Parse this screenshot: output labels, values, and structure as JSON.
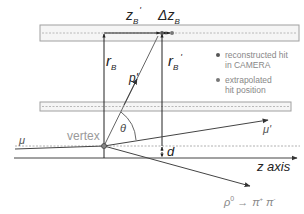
{
  "labels": {
    "z_b_prime": "z",
    "z_b_prime_sub": "B",
    "z_b_prime_sup": "'",
    "delta_z_b": "Δz",
    "delta_z_b_sub": "B",
    "r_b": "r",
    "r_b_sub": "B",
    "r_b_prime": "r",
    "r_b_prime_sub": "B",
    "r_b_prime_sup": "'",
    "p_prime": "p'",
    "theta": "θ",
    "mu": "μ",
    "mu_prime": "μ'",
    "vertex": "vertex",
    "d": "d",
    "z_axis": "z axis",
    "rho": "ρ",
    "rho_sup": "0",
    "arrow": "→",
    "pi_plus": "π",
    "pi_plus_sup": "+",
    "pi_minus": "π",
    "pi_minus_sup": "-"
  },
  "legend": {
    "items": [
      {
        "line1": "reconstructed hit",
        "line2": "in CAMERA"
      },
      {
        "line1": "extrapolated",
        "line2": "hit position"
      }
    ]
  },
  "colors": {
    "line": "#222222",
    "detector_edge": "#9a9a9a",
    "detector_fill": "#f4f4f4",
    "dashed": "#b0b0b0",
    "light_text": "#9a9a9a",
    "dot": "#777777"
  }
}
